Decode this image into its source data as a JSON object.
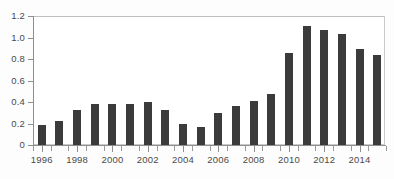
{
  "chart_data": {
    "type": "bar",
    "title": "",
    "subtitle": "",
    "xlabel": "",
    "ylabel": "",
    "categories": [
      1996,
      1997,
      1998,
      1999,
      2000,
      2001,
      2002,
      2003,
      2004,
      2005,
      2006,
      2007,
      2008,
      2009,
      2010,
      2011,
      2012,
      2013,
      2014,
      2015
    ],
    "values": [
      0.19,
      0.22,
      0.33,
      0.38,
      0.38,
      0.38,
      0.4,
      0.33,
      0.2,
      0.17,
      0.3,
      0.36,
      0.41,
      0.47,
      0.86,
      1.11,
      1.07,
      1.03,
      0.89,
      0.84
    ],
    "series": [
      {
        "name": "series-1",
        "values": [
          0.19,
          0.22,
          0.33,
          0.38,
          0.38,
          0.38,
          0.4,
          0.33,
          0.2,
          0.17,
          0.3,
          0.36,
          0.41,
          0.47,
          0.86,
          1.11,
          1.07,
          1.03,
          0.89,
          0.84
        ]
      }
    ],
    "ylim": [
      0,
      1.2
    ],
    "ytick_values": [
      0,
      0.2,
      0.4,
      0.6,
      0.8,
      1.0,
      1.2
    ],
    "ytick_labels": [
      "0",
      "0.2",
      "0.4",
      "0.6",
      "0.8",
      "1.0",
      "1.2"
    ],
    "xtick_labels": [
      "1996",
      "1998",
      "2000",
      "2002",
      "2004",
      "2006",
      "2008",
      "2010",
      "2012",
      "2014"
    ],
    "xtick_label_years": [
      1996,
      1998,
      2000,
      2002,
      2004,
      2006,
      2008,
      2010,
      2012,
      2014
    ],
    "grid": false,
    "legend": false,
    "legend_position": "none",
    "bar_color": "#3b3b3b",
    "axis_color": "#8f8f8f",
    "background_color": "#ffffff",
    "annotations": []
  }
}
